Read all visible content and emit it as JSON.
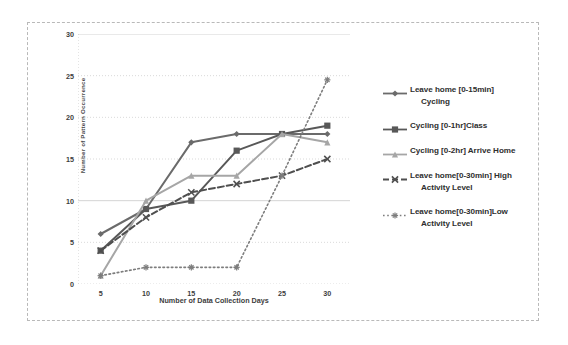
{
  "chart_data": {
    "type": "line",
    "title": "",
    "xlabel": "Number of Data Collection Days",
    "ylabel": "Number of Pattern Occurrence",
    "x": [
      5,
      10,
      15,
      20,
      25,
      30
    ],
    "xticks": [
      "5",
      "10",
      "15",
      "20",
      "25",
      "30"
    ],
    "yticks": [
      "0",
      "5",
      "10",
      "15",
      "20",
      "25",
      "30"
    ],
    "xlim": [
      2.5,
      32.5
    ],
    "ylim": [
      0,
      30
    ],
    "grid": true,
    "legend_position": "right",
    "series": [
      {
        "name": "Leave home [0-15min] Cycling",
        "label_line1": "Leave home [0-15min]",
        "label_line2": "Cycling",
        "marker": "diamond",
        "linestyle": "solid",
        "color": "#6b6b6b",
        "values": [
          6,
          9,
          17,
          18,
          18,
          18
        ]
      },
      {
        "name": "Cycling [0-1hr]Class",
        "label_line1": "Cycling [0-1hr]Class",
        "label_line2": "",
        "marker": "square",
        "linestyle": "solid",
        "color": "#585858",
        "values": [
          4,
          9,
          10,
          16,
          18,
          19
        ]
      },
      {
        "name": "Cycling [0-2hr] Arrive Home",
        "label_line1": "Cycling [0-2hr] Arrive Home",
        "label_line2": "",
        "marker": "triangle",
        "linestyle": "solid",
        "color": "#a6a6a6",
        "values": [
          1,
          10,
          13,
          13,
          18,
          17
        ]
      },
      {
        "name": "Leave home[0-30min] High Activity Level",
        "label_line1": "Leave home[0-30min] High",
        "label_line2": "Activity Level",
        "marker": "x",
        "linestyle": "dashed",
        "color": "#4f4f4f",
        "values": [
          4,
          8,
          11,
          12,
          13,
          15
        ]
      },
      {
        "name": "Leave home[0-30min]Low Activity Level",
        "label_line1": "Leave home[0-30min]Low",
        "label_line2": "Activity Level",
        "marker": "asterisk",
        "linestyle": "dotted",
        "color": "#7d7d7d",
        "values": [
          1,
          2,
          2,
          2,
          13,
          24.5
        ]
      }
    ]
  },
  "colors": {
    "grid": "#cfcfcf",
    "frame": "#b9b9b9",
    "text": "#3d3d3d",
    "background": "#ffffff"
  }
}
